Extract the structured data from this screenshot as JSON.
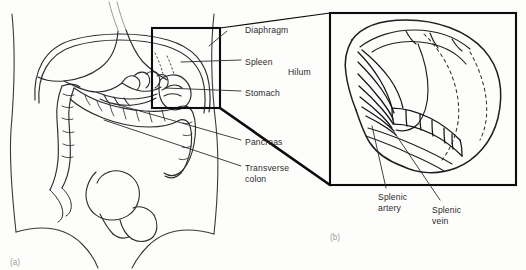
{
  "figure": {
    "panels": [
      {
        "id": "a",
        "caption": "(a)",
        "description": "anterior abdominal view"
      },
      {
        "id": "b",
        "caption": "(b)",
        "description": "spleen visceral surface detail"
      }
    ]
  },
  "labels": {
    "diaphragm": "Diaphragm",
    "spleen": "Spleen",
    "hilum": "Hilum",
    "stomach": "Stomach",
    "pancreas": "Pancreas",
    "transverse_colon": "Transverse\ncolon",
    "splenic_artery": "Splenic\nartery",
    "splenic_vein": "Splenic\nvein"
  },
  "colors": {
    "background": "#fdfdfc",
    "ink": "#1a1a1a",
    "text": "#2b2b2b",
    "caption_text": "#9d9d9d",
    "faint_ink": "#8d8d8d"
  }
}
